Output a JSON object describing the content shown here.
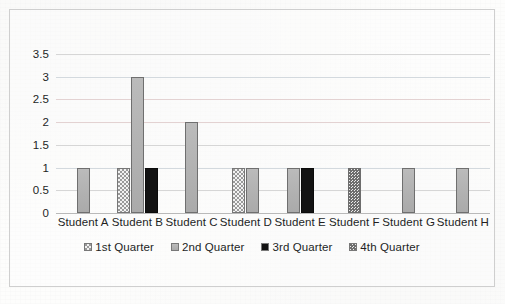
{
  "chart_data": {
    "type": "bar",
    "title": "",
    "xlabel": "",
    "ylabel": "",
    "ylim": [
      0,
      3.5
    ],
    "ytick_values": [
      0,
      0.5,
      1,
      1.5,
      2,
      2.5,
      3,
      3.5
    ],
    "ytick_labels": [
      "0",
      "0.5",
      "1",
      "1.5",
      "2",
      "2.5",
      "3",
      "3.5"
    ],
    "grid": true,
    "grid_axis": "y",
    "legend_position": "bottom",
    "categories": [
      "Student A",
      "Student B",
      "Student C",
      "Student D",
      "Student E",
      "Student F",
      "Student G",
      "Student H"
    ],
    "series": [
      {
        "name": "1st Quarter",
        "pattern": "light-stipple",
        "color": "#f2f2f2",
        "values": [
          0,
          1,
          0,
          1,
          0,
          0,
          0,
          0
        ]
      },
      {
        "name": "2nd Quarter",
        "pattern": "solid-gray",
        "color": "#b3b3b3",
        "values": [
          1,
          3,
          2,
          1,
          1,
          0,
          1,
          1
        ]
      },
      {
        "name": "3rd Quarter",
        "pattern": "solid-black",
        "color": "#131313",
        "values": [
          0,
          1,
          0,
          0,
          1,
          0,
          0,
          0
        ]
      },
      {
        "name": "4th Quarter",
        "pattern": "dense-stipple",
        "color": "#ededed",
        "values": [
          0,
          0,
          0,
          0,
          0,
          1,
          0,
          0
        ]
      }
    ]
  },
  "legend": {
    "items": [
      {
        "label": "1st Quarter"
      },
      {
        "label": "2nd Quarter"
      },
      {
        "label": "3rd Quarter"
      },
      {
        "label": "4th Quarter"
      }
    ]
  }
}
